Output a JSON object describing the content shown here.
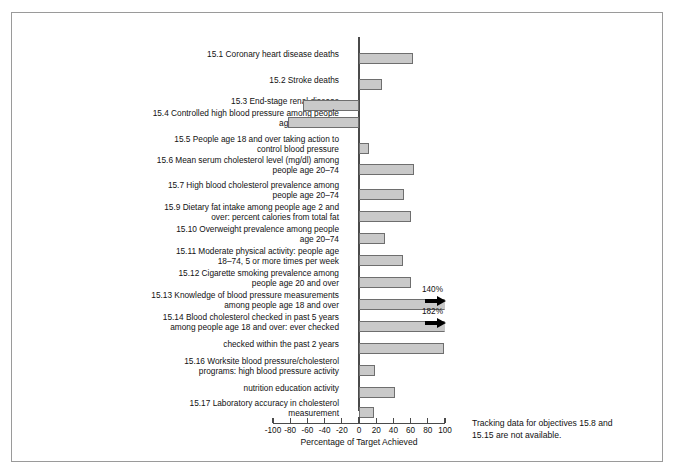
{
  "chart_data": {
    "type": "bar",
    "orientation": "horizontal",
    "title": "",
    "xlabel": "Percentage of Target Achieved",
    "ylabel": "",
    "xlim": [
      -100,
      100
    ],
    "xticks": [
      -100,
      -80,
      -60,
      -40,
      -20,
      0,
      20,
      40,
      60,
      80,
      100
    ],
    "xticklabels": [
      "-100",
      "-80",
      "-60",
      "-40",
      "-20",
      "0",
      "20",
      "40",
      "60",
      "80",
      "100"
    ],
    "grid": false,
    "legend": false,
    "zero_reference_line": true,
    "categories": [
      "15.1 Coronary heart disease deaths",
      "15.2 Stroke deaths",
      "15.3 End-stage renal disease",
      "15.4 Controlled high blood pressure among people\nage 18 and over",
      "15.5 People age 18 and over taking action to\ncontrol blood pressure",
      "15.6 Mean serum cholesterol level (mg/dl) among\npeople age 20–74",
      "15.7 High blood cholesterol prevalence among\npeople age 20–74",
      "15.9 Dietary fat intake among people age 2 and\nover: percent calories from total fat",
      "15.10 Overweight prevalence among people\nage 20–74",
      "15.11 Moderate physical activity: people age\n18–74, 5 or more times per week",
      "15.12 Cigarette smoking prevalence among\npeople age 20 and over",
      "15.13 Knowledge of blood pressure measurements\namong people age 18 and over",
      "15.14 Blood cholesterol checked in past 5 years\namong people age 18 and over: ever checked",
      "checked within the past 2 years",
      "15.16 Worksite blood pressure/cholesterol\nprograms: high blood pressure activity",
      "nutrition education activity",
      "15.17 Laboratory accuracy in cholesterol\nmeasurement"
    ],
    "values": [
      63,
      27,
      -65,
      -83,
      12,
      64,
      52,
      61,
      30,
      51,
      61,
      140,
      182,
      99,
      19,
      42,
      18
    ],
    "value_labels": [
      "",
      "",
      "",
      "",
      "",
      "",
      "",
      "",
      "",
      "",
      "",
      "140%",
      "182%",
      "",
      "",
      "",
      ""
    ],
    "clipped_at": [
      false,
      false,
      false,
      false,
      false,
      false,
      false,
      false,
      false,
      false,
      false,
      true,
      true,
      false,
      false,
      false,
      false
    ],
    "note": "Tracking data for objectives 15.8 and\n15.15 are not available."
  }
}
